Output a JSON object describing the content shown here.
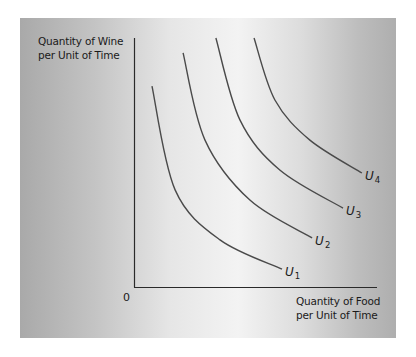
{
  "chart_data": {
    "type": "line",
    "title": "",
    "ylabel_lines": [
      "Quantity of Wine",
      "per Unit of Time"
    ],
    "xlabel_lines": [
      "Quantity of Food",
      "per Unit of Time"
    ],
    "origin_label": "0",
    "xlim": [
      0,
      10
    ],
    "ylim": [
      0,
      10
    ],
    "grid": false,
    "ticks": false,
    "legend": "none",
    "series": [
      {
        "name": "U",
        "subscript": "1",
        "points": [
          [
            0.74,
            8.07
          ],
          [
            1.69,
            3.9
          ],
          [
            3.54,
            1.89
          ],
          [
            6.09,
            0.72
          ]
        ]
      },
      {
        "name": "U",
        "subscript": "2",
        "points": [
          [
            2.02,
            9.4
          ],
          [
            2.92,
            5.9
          ],
          [
            4.77,
            3.49
          ],
          [
            7.33,
            1.97
          ]
        ]
      },
      {
        "name": "U",
        "subscript": "3",
        "points": [
          [
            3.37,
            10.0
          ],
          [
            4.36,
            6.71
          ],
          [
            6.0,
            4.7
          ],
          [
            8.6,
            3.17
          ]
        ]
      },
      {
        "name": "U",
        "subscript": "4",
        "points": [
          [
            4.94,
            10.0
          ],
          [
            5.8,
            7.51
          ],
          [
            7.24,
            5.9
          ],
          [
            9.38,
            4.58
          ]
        ]
      }
    ],
    "curve_color": "#4a4a4a",
    "axis_color": "#2a2a2a"
  }
}
